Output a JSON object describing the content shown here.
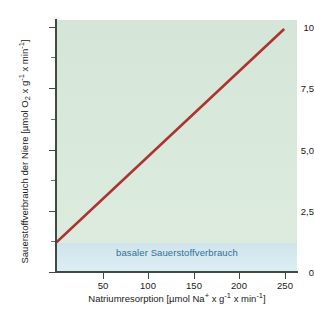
{
  "chart_data": {
    "type": "line",
    "title": "",
    "subtitle": "",
    "xlabel": "Natriumresorption [µmol Na⁺ x  g⁻¹ x min⁻¹]",
    "ylabel": "Sauerstoffverbrauch der Niere [µmol O₂ x g⁻¹ x min⁻¹]",
    "xlim": [
      0,
      265
    ],
    "ylim": [
      0,
      10.4
    ],
    "grid": false,
    "legend_position": "none",
    "x_ticks": [
      50,
      100,
      150,
      200,
      250
    ],
    "x_tick_labels": [
      "50",
      "100",
      "150",
      "200",
      "250"
    ],
    "y_ticks": [
      0,
      2.5,
      5.0,
      7.5,
      10
    ],
    "y_tick_labels": [
      "0",
      "2,5",
      "5,0",
      "7,5",
      "10"
    ],
    "y_minor_ticks": [
      1.25,
      3.75,
      6.25,
      8.75
    ],
    "series": [
      {
        "name": "Sauerstoffverbrauch",
        "color": "#ad3330",
        "x": [
          0,
          250
        ],
        "values": [
          1.25,
          10.0
        ]
      }
    ],
    "annotations": [
      {
        "text": "basaler Sauerstoffverbrauch",
        "color": "#2f6f9e",
        "y_range": [
          0,
          1.2
        ]
      }
    ],
    "plot_background_color": "#d8e8dc",
    "band_color": "#d5e8ef"
  },
  "axes": {
    "y_title_parts": {
      "lead": "Sauerstoffverbrauch der Niere [µmol O",
      "sub_o2": "2",
      "mid": " x g",
      "sup_g": "-1",
      "mid2": " x min",
      "sup_min": "-1",
      "tail": "]"
    },
    "x_title_parts": {
      "lead": "Natriumresorption [µmol Na",
      "sup_na": "+",
      "mid": " x  g",
      "sup_g": "-1",
      "mid2": " x min",
      "sup_min": "-1",
      "tail": "]"
    }
  },
  "band": {
    "label": "basaler Sauerstoffverbrauch"
  },
  "ticks": {
    "y": [
      {
        "label": "10",
        "value": 10
      },
      {
        "label": "7,5",
        "value": 7.5
      },
      {
        "label": "5,0",
        "value": 5.0
      },
      {
        "label": "2,5",
        "value": 2.5
      },
      {
        "label": "0",
        "value": 0
      }
    ],
    "y_minor": [
      8.75,
      6.25,
      3.75,
      1.25
    ],
    "x": [
      {
        "label": "50",
        "value": 50
      },
      {
        "label": "100",
        "value": 100
      },
      {
        "label": "150",
        "value": 150
      },
      {
        "label": "200",
        "value": 200
      },
      {
        "label": "250",
        "value": 250
      }
    ]
  }
}
